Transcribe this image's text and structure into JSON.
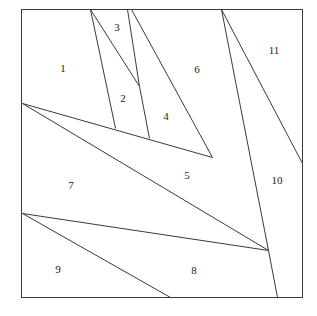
{
  "figure": {
    "type": "line-diagram",
    "canvas": {
      "width": 317,
      "height": 316,
      "background": "#ffffff"
    },
    "stroke_color": "#3a3a3a",
    "stroke_width": 1,
    "frame": {
      "name": "outer-square",
      "left": 21,
      "top": 9,
      "right": 302,
      "bottom": 297
    },
    "vertices": {
      "left_upper_fan": {
        "x": 22,
        "y": 103
      },
      "left_lower_fan": {
        "x": 22,
        "y": 213
      },
      "right_convergence": {
        "x": 268,
        "y": 250
      },
      "triangle_apex": {
        "x": 139,
        "y": 86
      },
      "top_origin_a": {
        "x": 90,
        "y": 9
      },
      "top_origin_b": {
        "x": 127,
        "y": 9
      },
      "top_origin_c": {
        "x": 221,
        "y": 9
      },
      "right_edge_point": {
        "x": 302,
        "y": 163
      },
      "bottom_point_left": {
        "x": 170,
        "y": 297
      },
      "bottom_point_right": {
        "x": 277,
        "y": 297
      }
    },
    "segments": [
      {
        "name": "segment-top-a-to-diagonal",
        "x1": 90,
        "y1": 9,
        "x2": 115,
        "y2": 128
      },
      {
        "name": "segment-top-a-to-apex",
        "x1": 90,
        "y1": 9,
        "x2": 139,
        "y2": 86
      },
      {
        "name": "segment-top-b-to-apex",
        "x1": 127,
        "y1": 9,
        "x2": 139,
        "y2": 86
      },
      {
        "name": "segment-apex-to-diagonal",
        "x1": 139,
        "y1": 86,
        "x2": 149,
        "y2": 138
      },
      {
        "name": "segment-top-b-to-upper-diagonal-end",
        "x1": 131,
        "y1": 9,
        "x2": 212,
        "y2": 157
      },
      {
        "name": "segment-top-c-to-convergence",
        "x1": 221,
        "y1": 9,
        "x2": 268,
        "y2": 250
      },
      {
        "name": "segment-top-c-to-right-edge",
        "x1": 221,
        "y1": 9,
        "x2": 302,
        "y2": 163
      },
      {
        "name": "segment-upper-fan-to-diagonal-end",
        "x1": 22,
        "y1": 103,
        "x2": 212,
        "y2": 157
      },
      {
        "name": "segment-upper-fan-to-convergence",
        "x1": 22,
        "y1": 103,
        "x2": 268,
        "y2": 250
      },
      {
        "name": "segment-lower-fan-to-convergence",
        "x1": 22,
        "y1": 213,
        "x2": 268,
        "y2": 250
      },
      {
        "name": "segment-lower-fan-to-bottom",
        "x1": 22,
        "y1": 213,
        "x2": 170,
        "y2": 297
      },
      {
        "name": "segment-convergence-to-bottom",
        "x1": 268,
        "y1": 250,
        "x2": 277,
        "y2": 297
      }
    ],
    "labels": [
      {
        "name": "region-label-1",
        "text": "1",
        "x": 63,
        "y": 68
      },
      {
        "name": "region-label-2",
        "text": "2",
        "x": 123,
        "y": 98
      },
      {
        "name": "region-label-3",
        "text": "3",
        "x": 117,
        "y": 27
      },
      {
        "name": "region-label-4",
        "text": "4",
        "x": 166,
        "y": 116
      },
      {
        "name": "region-label-5",
        "text": "5",
        "x": 187,
        "y": 175
      },
      {
        "name": "region-label-6",
        "text": "6",
        "x": 197,
        "y": 69
      },
      {
        "name": "region-label-7",
        "text": "7",
        "x": 71,
        "y": 185
      },
      {
        "name": "region-label-8",
        "text": "8",
        "x": 194,
        "y": 270
      },
      {
        "name": "region-label-9",
        "text": "9",
        "x": 58,
        "y": 269
      },
      {
        "name": "region-label-10",
        "text": "10",
        "x": 277,
        "y": 180
      },
      {
        "name": "region-label-11",
        "text": "11",
        "x": 274,
        "y": 50
      }
    ]
  }
}
